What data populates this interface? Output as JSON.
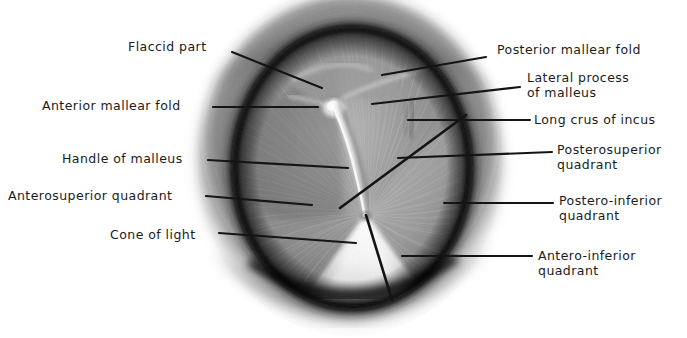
{
  "figure": {
    "background_color": "#ffffff",
    "ink_color": "#1b1b1b",
    "membrane": {
      "center_x": 352,
      "center_y": 168,
      "radius_x": 118,
      "radius_y": 140,
      "annulus_color": "#141414",
      "drum_color": "#8e8e8e",
      "cone_of_light_color": "#f2f2f2",
      "malleus_handle_color": "#f4f4f4"
    },
    "canal": {
      "outer_radius_x": 150,
      "outer_radius_y": 168,
      "wall_color": "#a8a8a8"
    }
  },
  "labels": {
    "left": [
      {
        "id": "flaccid-part",
        "text": "Flaccid part",
        "x": 128,
        "y": 40,
        "leader": {
          "x1": 232,
          "y1": 52,
          "x2": 322,
          "y2": 88
        }
      },
      {
        "id": "anterior-mallear-fold",
        "text": "Anterior mallear fold",
        "x": 42,
        "y": 99,
        "leader": {
          "x1": 213,
          "y1": 107,
          "x2": 318,
          "y2": 107
        }
      },
      {
        "id": "handle-of-malleus",
        "text": "Handle of malleus",
        "x": 62,
        "y": 152,
        "leader": {
          "x1": 208,
          "y1": 160,
          "x2": 348,
          "y2": 168
        }
      },
      {
        "id": "anterosuperior-quadrant",
        "text": "Anterosuperior quadrant",
        "x": 8,
        "y": 189,
        "leader": {
          "x1": 206,
          "y1": 196,
          "x2": 312,
          "y2": 205
        }
      },
      {
        "id": "cone-of-light",
        "text": "Cone of light",
        "x": 110,
        "y": 228,
        "leader": {
          "x1": 219,
          "y1": 233,
          "x2": 356,
          "y2": 243
        }
      }
    ],
    "right": [
      {
        "id": "posterior-mallear-fold",
        "text": "Posterior mallear fold",
        "x": 497,
        "y": 43,
        "leader": {
          "x1": 486,
          "y1": 57,
          "x2": 382,
          "y2": 75
        }
      },
      {
        "id": "lateral-process-of-malleus",
        "text": "Lateral process\nof malleus",
        "x": 527,
        "y": 71,
        "leader": {
          "x1": 520,
          "y1": 87,
          "x2": 372,
          "y2": 104
        }
      },
      {
        "id": "long-crus-of-incus",
        "text": "Long crus of incus",
        "x": 534,
        "y": 113,
        "leader": {
          "x1": 530,
          "y1": 120,
          "x2": 408,
          "y2": 120
        }
      },
      {
        "id": "posterosuperior-quadrant",
        "text": "Posterosuperior\nquadrant",
        "x": 557,
        "y": 143,
        "leader": {
          "x1": 552,
          "y1": 152,
          "x2": 398,
          "y2": 158
        }
      },
      {
        "id": "postero-inferior-quadrant",
        "text": "Postero-inferior\nquadrant",
        "x": 559,
        "y": 194,
        "leader": {
          "x1": 553,
          "y1": 203,
          "x2": 444,
          "y2": 203
        }
      },
      {
        "id": "antero-inferior-quadrant",
        "text": "Antero-inferior\nquadrant",
        "x": 538,
        "y": 249,
        "leader": {
          "x1": 532,
          "y1": 256,
          "x2": 402,
          "y2": 256
        }
      }
    ]
  },
  "quadrant_dividers": [
    {
      "id": "oblique-divider",
      "x1": 466,
      "y1": 115,
      "x2": 340,
      "y2": 208
    },
    {
      "id": "vertical-divider",
      "x1": 366,
      "y1": 215,
      "x2": 392,
      "y2": 300
    }
  ]
}
